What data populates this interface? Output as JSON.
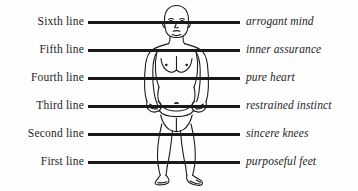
{
  "diagram": {
    "background_color": "#fefefe",
    "line_color": "#1a1a1a",
    "text_color": "#1d1d1d",
    "figure_name": "standing-human-figure",
    "rows": [
      {
        "left": "Sixth line",
        "right": "arrogant mind",
        "y": 21
      },
      {
        "left": "Fifth line",
        "right": "inner assurance",
        "y": 49
      },
      {
        "left": "Fourth line",
        "right": "pure heart",
        "y": 77
      },
      {
        "left": "Third line",
        "right": "restrained instinct",
        "y": 105
      },
      {
        "left": "Second line",
        "right": "sincere knees",
        "y": 133
      },
      {
        "left": "First line",
        "right": "purposeful feet",
        "y": 161
      }
    ]
  }
}
